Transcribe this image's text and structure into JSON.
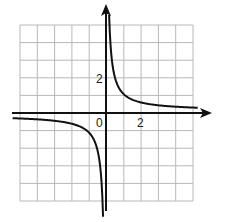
{
  "chart_data": {
    "type": "line",
    "title": "",
    "function": "y = 1/x",
    "xlabel": "",
    "ylabel": "",
    "xlim": [
      -4,
      3.4
    ],
    "ylim": [
      -4.9,
      5
    ],
    "grid": true,
    "tick_labels": {
      "origin": "0",
      "x": [
        "2"
      ],
      "y": [
        "2"
      ]
    },
    "series": [
      {
        "name": "left branch",
        "x": [
          -4,
          -3,
          -2,
          -1,
          -0.5,
          -0.25,
          -0.2
        ],
        "y": [
          -0.25,
          -0.33,
          -0.5,
          -1,
          -2,
          -4,
          -5
        ]
      },
      {
        "name": "right branch",
        "x": [
          0.2,
          0.25,
          0.5,
          1,
          2,
          3,
          4
        ],
        "y": [
          5,
          4,
          2,
          1,
          0.5,
          0.33,
          0.25
        ]
      }
    ],
    "colors": {
      "curve": "#111111",
      "axes": "#111111",
      "grid": "#b8b8b8"
    }
  },
  "labels": {
    "origin": "0",
    "x_tick": "2",
    "y_tick": "2"
  }
}
